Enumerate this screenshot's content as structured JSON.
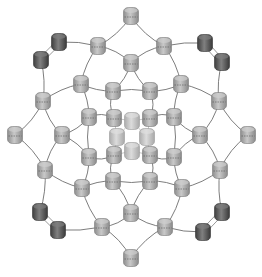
{
  "diagram": {
    "width": 262,
    "height": 277,
    "background": "#ffffff",
    "colors": {
      "edge": "#6e6e6e",
      "edge_faint": "#b8b8b8",
      "node_light_fill": "#a9a9a9",
      "node_light_top": "#cfcfcf",
      "node_light_stroke": "#7a7a7a",
      "node_dark_fill": "#555555",
      "node_dark_top": "#7d7d7d",
      "node_dark_stroke": "#333333",
      "node_center_fill": "#c4c4c4",
      "node_center_top": "#dedede"
    },
    "nodes": [
      {
        "id": "t0",
        "x": 131,
        "y": 16,
        "type": "light"
      },
      {
        "id": "t1",
        "x": 131,
        "y": 63,
        "type": "light"
      },
      {
        "id": "b0",
        "x": 131,
        "y": 258,
        "type": "light"
      },
      {
        "id": "b1",
        "x": 131,
        "y": 213,
        "type": "light"
      },
      {
        "id": "l0",
        "x": 15,
        "y": 135,
        "type": "light"
      },
      {
        "id": "l1",
        "x": 62,
        "y": 135,
        "type": "light"
      },
      {
        "id": "r0",
        "x": 248,
        "y": 135,
        "type": "light"
      },
      {
        "id": "r1",
        "x": 200,
        "y": 135,
        "type": "light"
      },
      {
        "id": "ul_d1",
        "x": 59,
        "y": 42,
        "type": "dark"
      },
      {
        "id": "ul_d2",
        "x": 41,
        "y": 60,
        "type": "dark"
      },
      {
        "id": "ur_d1",
        "x": 205,
        "y": 43,
        "type": "dark"
      },
      {
        "id": "ur_d2",
        "x": 222,
        "y": 62,
        "type": "dark"
      },
      {
        "id": "ll_d1",
        "x": 40,
        "y": 212,
        "type": "dark"
      },
      {
        "id": "ll_d2",
        "x": 58,
        "y": 230,
        "type": "dark"
      },
      {
        "id": "lr_d1",
        "x": 222,
        "y": 212,
        "type": "dark"
      },
      {
        "id": "lr_d2",
        "x": 203,
        "y": 232,
        "type": "dark"
      },
      {
        "id": "ul_a",
        "x": 98,
        "y": 46,
        "type": "light"
      },
      {
        "id": "ur_a",
        "x": 164,
        "y": 46,
        "type": "light"
      },
      {
        "id": "ll_a",
        "x": 45,
        "y": 170,
        "type": "light"
      },
      {
        "id": "lr_a",
        "x": 220,
        "y": 170,
        "type": "light"
      },
      {
        "id": "ul_b",
        "x": 43,
        "y": 101,
        "type": "light"
      },
      {
        "id": "ur_b",
        "x": 219,
        "y": 101,
        "type": "light"
      },
      {
        "id": "ll_b",
        "x": 102,
        "y": 227,
        "type": "light"
      },
      {
        "id": "lr_b",
        "x": 165,
        "y": 227,
        "type": "light"
      },
      {
        "id": "ul_c",
        "x": 81,
        "y": 84,
        "type": "light"
      },
      {
        "id": "ur_c",
        "x": 181,
        "y": 84,
        "type": "light"
      },
      {
        "id": "ll_c",
        "x": 82,
        "y": 188,
        "type": "light"
      },
      {
        "id": "lr_c",
        "x": 182,
        "y": 188,
        "type": "light"
      },
      {
        "id": "in_t_l",
        "x": 113,
        "y": 91,
        "type": "light"
      },
      {
        "id": "in_t_r",
        "x": 150,
        "y": 91,
        "type": "light"
      },
      {
        "id": "in_b_l",
        "x": 113,
        "y": 181,
        "type": "light"
      },
      {
        "id": "in_b_r",
        "x": 150,
        "y": 181,
        "type": "light"
      },
      {
        "id": "in_l_t",
        "x": 89,
        "y": 117,
        "type": "light"
      },
      {
        "id": "in_l_b",
        "x": 89,
        "y": 157,
        "type": "light"
      },
      {
        "id": "in_r_t",
        "x": 174,
        "y": 117,
        "type": "light"
      },
      {
        "id": "in_r_b",
        "x": 174,
        "y": 157,
        "type": "light"
      },
      {
        "id": "c_ul",
        "x": 114,
        "y": 118,
        "type": "light"
      },
      {
        "id": "c_ur",
        "x": 150,
        "y": 118,
        "type": "light"
      },
      {
        "id": "c_ll",
        "x": 114,
        "y": 155,
        "type": "light"
      },
      {
        "id": "c_lr",
        "x": 150,
        "y": 155,
        "type": "light"
      },
      {
        "id": "cc_t",
        "x": 132,
        "y": 121,
        "type": "center"
      },
      {
        "id": "cc_b",
        "x": 132,
        "y": 151,
        "type": "center"
      },
      {
        "id": "cc_l",
        "x": 117,
        "y": 137,
        "type": "center"
      },
      {
        "id": "cc_r",
        "x": 147,
        "y": 137,
        "type": "center"
      }
    ],
    "edges": [
      {
        "a": "t0",
        "b": "ul_a",
        "bend": -6
      },
      {
        "a": "t0",
        "b": "ur_a",
        "bend": 6
      },
      {
        "a": "t1",
        "b": "ul_a",
        "bend": 6
      },
      {
        "a": "t1",
        "b": "ur_a",
        "bend": -6
      },
      {
        "a": "b0",
        "b": "ll_b",
        "bend": 6
      },
      {
        "a": "b0",
        "b": "lr_b",
        "bend": -6
      },
      {
        "a": "b1",
        "b": "ll_b",
        "bend": -6
      },
      {
        "a": "b1",
        "b": "lr_b",
        "bend": 6
      },
      {
        "a": "l0",
        "b": "ul_b",
        "bend": 6
      },
      {
        "a": "l0",
        "b": "ll_a",
        "bend": -6
      },
      {
        "a": "l1",
        "b": "ul_b",
        "bend": -6
      },
      {
        "a": "l1",
        "b": "ll_a",
        "bend": 6
      },
      {
        "a": "r0",
        "b": "ur_b",
        "bend": -6
      },
      {
        "a": "r0",
        "b": "lr_a",
        "bend": 6
      },
      {
        "a": "r1",
        "b": "ur_b",
        "bend": 6
      },
      {
        "a": "r1",
        "b": "lr_a",
        "bend": -6
      },
      {
        "a": "ul_a",
        "b": "ul_d1",
        "bend": 3
      },
      {
        "a": "ul_d2",
        "b": "ul_b",
        "bend": -4
      },
      {
        "a": "ur_a",
        "b": "ur_d1",
        "bend": -3
      },
      {
        "a": "ur_d2",
        "b": "ur_b",
        "bend": 4
      },
      {
        "a": "ll_a",
        "b": "ll_d1",
        "bend": -4
      },
      {
        "a": "ll_d2",
        "b": "ll_b",
        "bend": 3
      },
      {
        "a": "lr_a",
        "b": "lr_d1",
        "bend": 4
      },
      {
        "a": "lr_d2",
        "b": "lr_b",
        "bend": -3
      },
      {
        "a": "ul_a",
        "b": "ul_c",
        "bend": 5
      },
      {
        "a": "ul_b",
        "b": "ul_c",
        "bend": -5
      },
      {
        "a": "ur_a",
        "b": "ur_c",
        "bend": -5
      },
      {
        "a": "ur_b",
        "b": "ur_c",
        "bend": 5
      },
      {
        "a": "ll_a",
        "b": "ll_c",
        "bend": 5
      },
      {
        "a": "ll_b",
        "b": "ll_c",
        "bend": -5
      },
      {
        "a": "lr_a",
        "b": "lr_c",
        "bend": -5
      },
      {
        "a": "lr_b",
        "b": "lr_c",
        "bend": 5
      },
      {
        "a": "t1",
        "b": "in_t_l",
        "bend": -5
      },
      {
        "a": "t1",
        "b": "in_t_r",
        "bend": 5
      },
      {
        "a": "b1",
        "b": "in_b_l",
        "bend": 5
      },
      {
        "a": "b1",
        "b": "in_b_r",
        "bend": -5
      },
      {
        "a": "l1",
        "b": "in_l_t",
        "bend": 5
      },
      {
        "a": "l1",
        "b": "in_l_b",
        "bend": -5
      },
      {
        "a": "r1",
        "b": "in_r_t",
        "bend": -5
      },
      {
        "a": "r1",
        "b": "in_r_b",
        "bend": 5
      },
      {
        "a": "ul_c",
        "b": "in_t_l",
        "bend": 4
      },
      {
        "a": "ul_c",
        "b": "in_l_t",
        "bend": -4
      },
      {
        "a": "ur_c",
        "b": "in_t_r",
        "bend": -4
      },
      {
        "a": "ur_c",
        "b": "in_r_t",
        "bend": 4
      },
      {
        "a": "ll_c",
        "b": "in_b_l",
        "bend": -4
      },
      {
        "a": "ll_c",
        "b": "in_l_b",
        "bend": 4
      },
      {
        "a": "lr_c",
        "b": "in_b_r",
        "bend": 4
      },
      {
        "a": "lr_c",
        "b": "in_r_b",
        "bend": -4
      },
      {
        "a": "in_t_l",
        "b": "in_t_r",
        "bend": -3
      },
      {
        "a": "in_b_l",
        "b": "in_b_r",
        "bend": 3
      },
      {
        "a": "in_l_t",
        "b": "in_l_b",
        "bend": 3
      },
      {
        "a": "in_r_t",
        "b": "in_r_b",
        "bend": -3
      },
      {
        "a": "in_t_l",
        "b": "c_ul",
        "bend": 6
      },
      {
        "a": "in_l_t",
        "b": "c_ul",
        "bend": -6
      },
      {
        "a": "in_t_r",
        "b": "c_ur",
        "bend": -6
      },
      {
        "a": "in_r_t",
        "b": "c_ur",
        "bend": 6
      },
      {
        "a": "in_b_l",
        "b": "c_ll",
        "bend": -6
      },
      {
        "a": "in_l_b",
        "b": "c_ll",
        "bend": 6
      },
      {
        "a": "in_b_r",
        "b": "c_lr",
        "bend": 6
      },
      {
        "a": "in_r_b",
        "b": "c_lr",
        "bend": -6
      }
    ],
    "faint_edges": [
      {
        "a": "cc_t",
        "b": "cc_l"
      },
      {
        "a": "cc_t",
        "b": "cc_r"
      },
      {
        "a": "cc_b",
        "b": "cc_l"
      },
      {
        "a": "cc_b",
        "b": "cc_r"
      },
      {
        "a": "c_ul",
        "b": "cc_t"
      },
      {
        "a": "c_ur",
        "b": "cc_t"
      },
      {
        "a": "c_ll",
        "b": "cc_b"
      },
      {
        "a": "c_lr",
        "b": "cc_b"
      },
      {
        "a": "c_ul",
        "b": "cc_l"
      },
      {
        "a": "c_ll",
        "b": "cc_l"
      },
      {
        "a": "c_ur",
        "b": "cc_r"
      },
      {
        "a": "c_lr",
        "b": "cc_r"
      }
    ],
    "dimer_pairs": [
      {
        "a": "ul_d1",
        "b": "ul_d2"
      },
      {
        "a": "ur_d1",
        "b": "ur_d2"
      },
      {
        "a": "ll_d1",
        "b": "ll_d2"
      },
      {
        "a": "lr_d1",
        "b": "lr_d2"
      }
    ]
  }
}
